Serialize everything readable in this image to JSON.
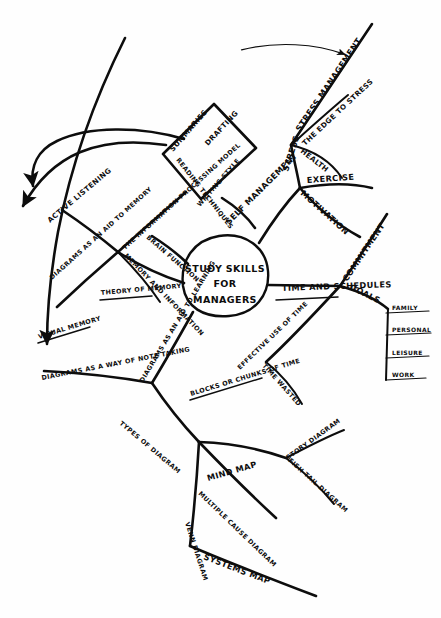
{
  "diagram": {
    "kind": "hand-drawn-mind-map",
    "ink_color": "#0d0d0d",
    "paper_color": "#fefefe",
    "width": 441,
    "height": 618
  },
  "center": {
    "line1": "STUDY SKILLS",
    "line2": "FOR",
    "line3": "MANAGERS"
  },
  "branches": {
    "self_management": {
      "label": "SELF MANAGEMENT",
      "children": {
        "stress": {
          "label": "STRESS",
          "children": [
            {
              "label": "STRESS MANAGEMENT"
            },
            {
              "label": "THE EDGE TO STRESS"
            },
            {
              "label": "HEALTH"
            }
          ]
        },
        "exercise": {
          "label": "EXERCISE"
        },
        "motivation": {
          "label": "MOTIVATION"
        }
      }
    },
    "reading_writing": {
      "shape": "diamond",
      "labels": {
        "top_left": "SUMMARIES",
        "top_right": "DRAFTING",
        "bottom_left": "READING TECHNIQUES",
        "bottom_right": "WRITING STYLE"
      }
    },
    "memory": {
      "information_model": "THE INFORMATION PROCESSING MODEL",
      "memory_and_information": "MEMORY AND INFORMATION",
      "active_listening": "ACTIVE LISTENING",
      "brain_function": "BRAIN FUNCTION",
      "theory_of_memory": "THEORY OF MEMORY",
      "diagrams_aid_memory": "DIAGRAMS AS AN AID TO MEMORY",
      "visual_memory": "VISUAL MEMORY"
    },
    "time": {
      "label": "TIME AND SCHEDULES",
      "commitment": "COMMITMENT",
      "goals": "GOALS",
      "goal_items": [
        "FAMILY",
        "PERSONAL",
        "LEISURE",
        "WORK"
      ],
      "effective_use": "EFFECTIVE USE OF TIME",
      "blocks": "BLOCKS OR CHUNKS OF TIME",
      "time_wasted": "TIME WASTED"
    },
    "diagrams": {
      "note_taking": "DIAGRAMS AS A WAY OF NOTE TAKING",
      "aid_to_learning": "DIAGRAMS AS AN AID TO LEARNING",
      "types": "TYPES OF DIAGRAM",
      "mind_map": "MIND MAP",
      "story_diagram": "STORY DIAGRAM",
      "fish_tail_diagram": "FISH TAIL DIAGRAM",
      "multiple_cause_diagram": "MULTIPLE CAUSE DIAGRAM",
      "venn_diagram": "VENN DIAGRAM",
      "systems_map": "SYSTEMS MAP"
    }
  }
}
